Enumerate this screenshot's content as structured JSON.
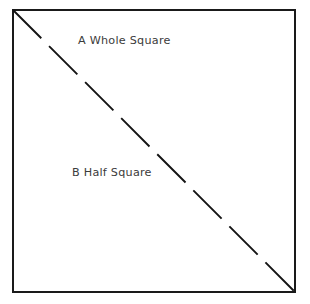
{
  "figure": {
    "type": "geometry-diagram",
    "background_color": "#ffffff",
    "shape": {
      "name": "square",
      "outline_color": "#1a1a1a",
      "outline_width": 1.6,
      "fill": "none",
      "x": 13,
      "y": 10,
      "width": 282,
      "height": 282
    },
    "divider": {
      "name": "diagonal-dashed-line",
      "style": "dashed",
      "color": "#141414",
      "width": 1.9,
      "from": [
        13,
        10
      ],
      "to": [
        295,
        292
      ],
      "dash_length": 40,
      "gap_length": 11,
      "dash_count": 7
    },
    "labels": [
      {
        "id": "whole-square",
        "text": "A Whole Square",
        "region": "upper-right-triangle",
        "color": "#3b3b3b",
        "x": 78,
        "y": 35
      },
      {
        "id": "half-square",
        "text": "B Half Square",
        "region": "lower-left-triangle",
        "color": "#3b3b3b",
        "x": 72,
        "y": 167
      }
    ]
  },
  "chart_data": {
    "type": "diagram",
    "title": "",
    "subtitle": "",
    "xlabel": "",
    "ylabel": "",
    "grid": false,
    "legend": "none",
    "annotations": [
      "A Whole Square",
      "B Half Square"
    ],
    "regions": [
      {
        "label": "A Whole Square",
        "shape": "square",
        "fraction": 1.0
      },
      {
        "label": "B Half Square",
        "shape": "triangle",
        "fraction": 0.5
      }
    ]
  }
}
